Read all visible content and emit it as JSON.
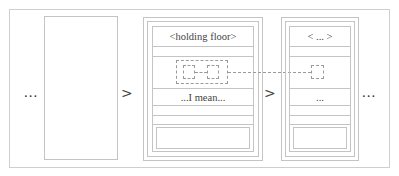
{
  "diagram": {
    "left_ellipsis": "...",
    "arrow_1": ">",
    "arrow_2": ">",
    "right_ellipsis": "...",
    "middle_panel": {
      "header": "<holding floor>",
      "content_row": "...I mean..."
    },
    "right_panel": {
      "header": "< ... >",
      "content_row": "..."
    },
    "colors": {
      "border": "#c4c4c4",
      "dotted": "#9a9a9a",
      "text": "#444444"
    }
  }
}
